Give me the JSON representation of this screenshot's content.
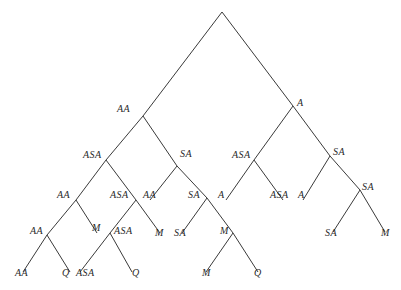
{
  "diagram": {
    "type": "binary-tree",
    "line_color": "#3a3a3a",
    "label_color": "#2a2a2a",
    "nodes": [
      {
        "id": "root",
        "label": "",
        "x": 222,
        "y": 12,
        "parent": null
      },
      {
        "id": "n1",
        "label": "AA",
        "x": 143,
        "y": 116,
        "parent": "root",
        "lx": 117,
        "ly": 104
      },
      {
        "id": "n2",
        "label": "A",
        "x": 293,
        "y": 106,
        "parent": "root",
        "lx": 297,
        "ly": 98
      },
      {
        "id": "n3",
        "label": "ASA",
        "x": 106,
        "y": 160,
        "parent": "n1",
        "lx": 83,
        "ly": 150
      },
      {
        "id": "n4",
        "label": "SA",
        "x": 177,
        "y": 166,
        "parent": "n1",
        "lx": 180,
        "ly": 149
      },
      {
        "id": "n5",
        "label": "ASA",
        "x": 254,
        "y": 160,
        "parent": "n2",
        "lx": 232,
        "ly": 150
      },
      {
        "id": "n6",
        "label": "SA",
        "x": 330,
        "y": 156,
        "parent": "n2",
        "lx": 333,
        "ly": 147
      },
      {
        "id": "n7",
        "label": "AA",
        "x": 76,
        "y": 200,
        "parent": "n3",
        "lx": 57,
        "ly": 190
      },
      {
        "id": "n8",
        "label": "ASA",
        "x": 136,
        "y": 200,
        "parent": "n3",
        "lx": 110,
        "ly": 190
      },
      {
        "id": "n9",
        "label": "AA",
        "x": 150,
        "y": 200,
        "parent": "n4",
        "lx": 143,
        "ly": 190,
        "leaf": true
      },
      {
        "id": "n10",
        "label": "SA",
        "x": 207,
        "y": 198,
        "parent": "n4",
        "lx": 188,
        "ly": 190
      },
      {
        "id": "n11",
        "label": "A",
        "x": 226,
        "y": 200,
        "parent": "n5",
        "lx": 218,
        "ly": 190,
        "leaf": true
      },
      {
        "id": "n12",
        "label": "ASA",
        "x": 283,
        "y": 200,
        "parent": "n5",
        "lx": 270,
        "ly": 190,
        "leaf": true
      },
      {
        "id": "n13",
        "label": "A",
        "x": 303,
        "y": 200,
        "parent": "n6",
        "lx": 298,
        "ly": 190,
        "leaf": true
      },
      {
        "id": "n14",
        "label": "SA",
        "x": 360,
        "y": 190,
        "parent": "n6",
        "lx": 362,
        "ly": 182
      },
      {
        "id": "n15",
        "label": "AA",
        "x": 47,
        "y": 235,
        "parent": "n7",
        "lx": 30,
        "ly": 226
      },
      {
        "id": "n16",
        "label": "M",
        "x": 97,
        "y": 233,
        "parent": "n7",
        "lx": 92,
        "ly": 223,
        "leaf": true
      },
      {
        "id": "n17",
        "label": "ASA",
        "x": 110,
        "y": 233,
        "parent": "n8",
        "lx": 114,
        "ly": 226
      },
      {
        "id": "n18",
        "label": "M",
        "x": 160,
        "y": 233,
        "parent": "n8",
        "lx": 155,
        "ly": 228,
        "leaf": true
      },
      {
        "id": "n19",
        "label": "SA",
        "x": 182,
        "y": 233,
        "parent": "n10",
        "lx": 174,
        "ly": 228,
        "leaf": true
      },
      {
        "id": "n20",
        "label": "M",
        "x": 233,
        "y": 233,
        "parent": "n10",
        "lx": 220,
        "ly": 226
      },
      {
        "id": "n21",
        "label": "SA",
        "x": 333,
        "y": 232,
        "parent": "n14",
        "lx": 325,
        "ly": 228,
        "leaf": true
      },
      {
        "id": "n22",
        "label": "M",
        "x": 385,
        "y": 232,
        "parent": "n14",
        "lx": 381,
        "ly": 228,
        "leaf": true
      },
      {
        "id": "n23",
        "label": "AA",
        "x": 23,
        "y": 272,
        "parent": "n15",
        "lx": 15,
        "ly": 268,
        "leaf": true
      },
      {
        "id": "n24",
        "label": "Q",
        "x": 70,
        "y": 272,
        "parent": "n15",
        "lx": 62,
        "ly": 268,
        "leaf": true
      },
      {
        "id": "n25",
        "label": "ASA",
        "x": 80,
        "y": 272,
        "parent": "n17",
        "lx": 76,
        "ly": 268,
        "leaf": true
      },
      {
        "id": "n26",
        "label": "Q",
        "x": 132,
        "y": 272,
        "parent": "n17",
        "lx": 132,
        "ly": 268,
        "leaf": true
      },
      {
        "id": "n27",
        "label": "M",
        "x": 206,
        "y": 272,
        "parent": "n20",
        "lx": 202,
        "ly": 268,
        "leaf": true
      },
      {
        "id": "n28",
        "label": "Q",
        "x": 258,
        "y": 272,
        "parent": "n20",
        "lx": 254,
        "ly": 268,
        "leaf": true
      }
    ]
  }
}
